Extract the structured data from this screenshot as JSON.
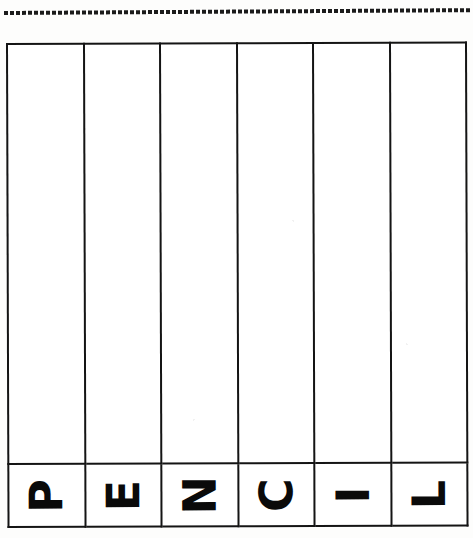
{
  "worksheet": {
    "dotted_guide": {
      "name": "dotted-tracing-line",
      "dot_count": 78,
      "color": "#1b1b1b"
    },
    "grid": {
      "columns": 6,
      "rows": 2,
      "border_color": "#141414",
      "cell_background": "#ffffff",
      "body_row_label": "",
      "letters": [
        {
          "char": "P",
          "rotation": "-90deg"
        },
        {
          "char": "E",
          "rotation": "-90deg"
        },
        {
          "char": "N",
          "rotation": "-90deg"
        },
        {
          "char": "C",
          "rotation": "-90deg"
        },
        {
          "char": "I",
          "rotation": "-90deg"
        },
        {
          "char": "L",
          "rotation": "-90deg"
        }
      ],
      "word": "PENCIL",
      "empty_cells": [
        "",
        "",
        "",
        "",
        "",
        ""
      ]
    }
  }
}
